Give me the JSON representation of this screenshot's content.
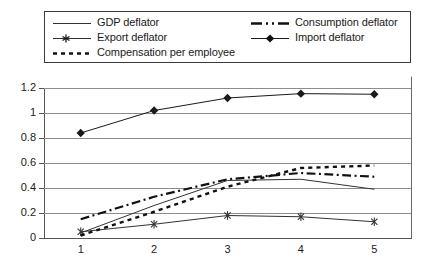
{
  "chart_data": {
    "type": "line",
    "title": "",
    "subtitle": "",
    "xlabel": "",
    "ylabel": "",
    "categories": [
      "1",
      "2",
      "3",
      "4",
      "5"
    ],
    "xtick_labels": [
      "1",
      "2",
      "3",
      "4",
      "5"
    ],
    "ytick_labels": [
      "0",
      "0.2",
      "0.4",
      "0.6",
      "0.8",
      "1",
      "1.2"
    ],
    "ytick_values": [
      0,
      0.2,
      0.4,
      0.6,
      0.8,
      1,
      1.2
    ],
    "ylim": [
      0,
      1.2
    ],
    "grid": "horizontal",
    "legend_position": "top",
    "legend_columns": 2,
    "series": [
      {
        "name": "GDP deflator",
        "style": "solid",
        "marker": "none",
        "color": "#333333",
        "width": 1,
        "values": [
          0.04,
          0.26,
          0.46,
          0.47,
          0.39
        ]
      },
      {
        "name": "Export deflator",
        "style": "solid",
        "marker": "asterisk",
        "color": "#333333",
        "width": 1,
        "values": [
          0.05,
          0.11,
          0.18,
          0.17,
          0.13
        ]
      },
      {
        "name": "Compensation per employee",
        "style": "dotted",
        "marker": "none",
        "color": "#111111",
        "width": 2.4,
        "values": [
          0.02,
          0.21,
          0.41,
          0.56,
          0.58
        ]
      },
      {
        "name": "Consumption deflator",
        "style": "dashdot",
        "marker": "none",
        "color": "#111111",
        "width": 2.2,
        "values": [
          0.15,
          0.33,
          0.47,
          0.52,
          0.49
        ]
      },
      {
        "name": "Import deflator",
        "style": "solid",
        "marker": "diamond",
        "color": "#1a1a1a",
        "width": 1,
        "values": [
          0.84,
          1.02,
          1.12,
          1.155,
          1.15
        ]
      }
    ]
  },
  "legend": {
    "left_column": [
      {
        "label": "GDP deflator",
        "sample": "line-solid-thin"
      },
      {
        "label": "Export deflator",
        "sample": "line-solid-asterisk"
      },
      {
        "label": "Compensation per employee",
        "sample": "line-dotted-thick"
      }
    ],
    "right_column": [
      {
        "label": "Consumption deflator",
        "sample": "line-dashdot-thick"
      },
      {
        "label": "Import deflator",
        "sample": "line-solid-diamond"
      }
    ]
  },
  "axes": {
    "y": {
      "ticks": [
        {
          "label": "1.2",
          "value": 1.2
        },
        {
          "label": "1",
          "value": 1.0
        },
        {
          "label": "0.8",
          "value": 0.8
        },
        {
          "label": "0.6",
          "value": 0.6
        },
        {
          "label": "0.4",
          "value": 0.4
        },
        {
          "label": "0.2",
          "value": 0.2
        },
        {
          "label": "0",
          "value": 0.0
        }
      ]
    },
    "x": {
      "ticks": [
        {
          "label": "1"
        },
        {
          "label": "2"
        },
        {
          "label": "3"
        },
        {
          "label": "4"
        },
        {
          "label": "5"
        }
      ]
    }
  }
}
